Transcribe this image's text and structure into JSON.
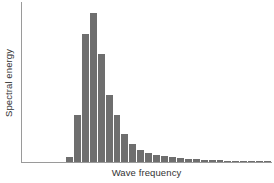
{
  "chart_data": {
    "type": "bar",
    "title": "",
    "subtitle": "",
    "xlabel": "Wave frequency",
    "ylabel": "Spectral energy",
    "grid": false,
    "legend": false,
    "legend_position": "none",
    "bar_color": "#6e6e6e",
    "axis_color": "#9a9a9a",
    "background_color": "#ffffff",
    "axis_tick_labels_x": [],
    "axis_tick_labels_y": [],
    "xlim": [
      0,
      26
    ],
    "ylim": [
      0,
      1
    ],
    "categories": [
      "1",
      "2",
      "3",
      "4",
      "5",
      "6",
      "7",
      "8",
      "9",
      "10",
      "11",
      "12",
      "13",
      "14",
      "15",
      "16",
      "17",
      "18",
      "19",
      "20",
      "21",
      "22",
      "23",
      "24",
      "25",
      "26"
    ],
    "values": [
      0.032,
      0.295,
      0.8,
      0.93,
      0.672,
      0.42,
      0.295,
      0.175,
      0.112,
      0.072,
      0.055,
      0.044,
      0.036,
      0.029,
      0.024,
      0.02,
      0.017,
      0.014,
      0.012,
      0.011,
      0.009,
      0.008,
      0.007,
      0.006,
      0.005,
      0.004
    ]
  },
  "labels": {
    "y_axis_title": "Spectral energy",
    "x_axis_title": "Wave frequency"
  }
}
